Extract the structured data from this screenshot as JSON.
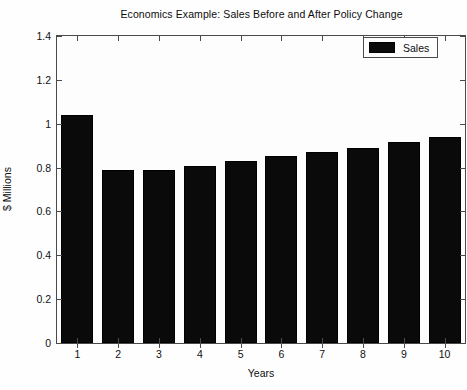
{
  "chart_data": {
    "type": "bar",
    "title": "Economics Example: Sales Before and After Policy Change",
    "xlabel": "Years",
    "ylabel": "$ Millions",
    "categories": [
      "1",
      "2",
      "3",
      "4",
      "5",
      "6",
      "7",
      "8",
      "9",
      "10"
    ],
    "values": [
      1.04,
      0.79,
      0.79,
      0.805,
      0.83,
      0.855,
      0.87,
      0.89,
      0.915,
      0.94
    ],
    "series": [
      {
        "name": "Sales",
        "color": "#0a0a0a",
        "values": [
          1.04,
          0.79,
          0.79,
          0.805,
          0.83,
          0.855,
          0.87,
          0.89,
          0.915,
          0.94
        ]
      }
    ],
    "ylim": [
      0,
      1.4
    ],
    "yticks": [
      0,
      0.2,
      0.4,
      0.6,
      0.8,
      1,
      1.2,
      1.4
    ],
    "ytick_labels": [
      "0",
      "0.2",
      "0.4",
      "0.6",
      "0.8",
      "1",
      "1.2",
      "1.4"
    ],
    "xticks": [
      "1",
      "2",
      "3",
      "4",
      "5",
      "6",
      "7",
      "8",
      "9",
      "10"
    ],
    "grid": false,
    "legend": {
      "position": "top-right",
      "entries": [
        {
          "label": "Sales",
          "color": "#0a0a0a"
        }
      ]
    }
  },
  "legend_label": "Sales"
}
